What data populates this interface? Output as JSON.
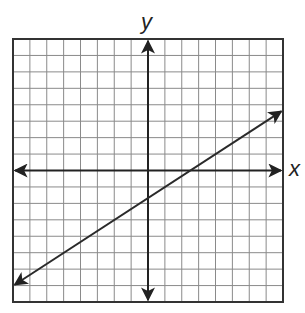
{
  "figure": {
    "type": "coordinate-plane-with-line",
    "x_axis_label": "x",
    "y_axis_label": "y",
    "grid": {
      "x_min": -8,
      "x_max": 8,
      "y_min": -8,
      "y_max": 8,
      "step": 1,
      "show_tick_labels": false
    },
    "line": {
      "slope": "2/3",
      "y_intercept": "-5/3",
      "equation": "y = (2/3)x - 5/3",
      "lattice_points": [
        [
          -5,
          -5
        ],
        [
          -2,
          -3
        ],
        [
          1,
          -1
        ],
        [
          4,
          1
        ],
        [
          7,
          3
        ]
      ],
      "x_intercept": 2.5,
      "arrows_both_ends": true,
      "visible_start": [
        -7.9,
        -6.95
      ],
      "visible_end": [
        7.9,
        3.6
      ]
    },
    "colors": {
      "background": "#ffffff",
      "grid_line": "#8a8a8a",
      "border": "#333333",
      "axis": "#222222",
      "plotted_line": "#2a2a2a"
    }
  },
  "chart_data": {
    "type": "line",
    "title": "",
    "xlabel": "x",
    "ylabel": "y",
    "xlim": [
      -8,
      8
    ],
    "ylim": [
      -8,
      8
    ],
    "grid": true,
    "tick_labels_shown": false,
    "series": [
      {
        "name": "y = (2/3)x - 5/3",
        "x": [
          -5,
          -2,
          1,
          4,
          7
        ],
        "y": [
          -5,
          -3,
          -1,
          1,
          3
        ]
      }
    ]
  }
}
